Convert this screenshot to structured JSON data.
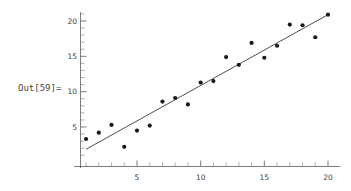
{
  "output_label": "Out[59]=",
  "colors": {
    "point": "#1a1a1a",
    "line": "#3a3a3a",
    "axis": "#5a5a5a",
    "text": "#3d3d3d",
    "label": "#454545",
    "background": "#ffffff"
  },
  "chart_data": {
    "type": "scatter",
    "title": "",
    "xlabel": "",
    "ylabel": "",
    "xlim": [
      0,
      21
    ],
    "ylim": [
      0,
      22
    ],
    "grid": false,
    "legend": null,
    "x_ticks_major": [
      5,
      10,
      15,
      20
    ],
    "y_ticks_major": [
      5,
      10,
      15,
      20
    ],
    "x_ticks_minor": [
      1,
      2,
      3,
      4,
      6,
      7,
      8,
      9,
      11,
      12,
      13,
      14,
      16,
      17,
      18,
      19
    ],
    "y_ticks_minor": [
      1,
      2,
      3,
      4,
      6,
      7,
      8,
      9,
      11,
      12,
      13,
      14,
      16,
      17,
      18,
      19,
      21
    ],
    "x_tick_labels": [
      "5",
      "10",
      "15",
      "20"
    ],
    "y_tick_labels": [
      "5",
      "10",
      "15",
      "20"
    ],
    "x": [
      1,
      2,
      3,
      4,
      5,
      6,
      7,
      8,
      9,
      10,
      11,
      12,
      13,
      14,
      15,
      16,
      17,
      18,
      19,
      20
    ],
    "y": [
      3.3,
      4.2,
      5.3,
      2.2,
      4.5,
      5.2,
      8.6,
      9.1,
      8.2,
      11.3,
      11.5,
      14.9,
      13.8,
      16.9,
      14.8,
      16.5,
      19.5,
      19.4,
      17.7,
      20.9
    ],
    "series": [
      {
        "name": "data",
        "type": "scatter",
        "marker": "filled-circle",
        "values": [
          3.3,
          4.2,
          5.3,
          2.2,
          4.5,
          5.2,
          8.6,
          9.1,
          8.2,
          11.3,
          11.5,
          14.9,
          13.8,
          16.9,
          14.8,
          16.5,
          19.5,
          19.4,
          17.7,
          20.9
        ]
      },
      {
        "name": "fit-line",
        "type": "line",
        "endpoints": [
          [
            1,
            1.85
          ],
          [
            20,
            20.9
          ]
        ]
      }
    ]
  }
}
